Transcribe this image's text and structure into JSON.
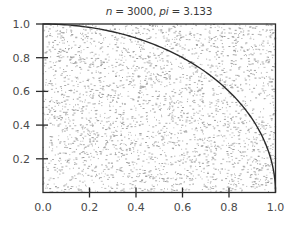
{
  "chart_data": {
    "type": "scatter",
    "title": "n = 3000, pi = 3.133",
    "title_parts": {
      "n_label": "n",
      "n_value": "3000",
      "pi_label": "pi",
      "pi_value": "3.133"
    },
    "xlabel": "",
    "ylabel": "",
    "xlim": [
      0.0,
      1.0
    ],
    "ylim": [
      0.0,
      1.0
    ],
    "x_ticks": [
      0.0,
      0.2,
      0.4,
      0.6,
      0.8,
      1.0
    ],
    "x_tick_labels": [
      "0.0",
      "0.2",
      "0.4",
      "0.6",
      "0.8",
      "1.0"
    ],
    "y_ticks": [
      0.2,
      0.4,
      0.6,
      0.8,
      1.0
    ],
    "y_tick_labels": [
      "0.2",
      "0.4",
      "0.6",
      "0.8",
      "1.0"
    ],
    "grid": false,
    "legend": null,
    "series": [
      {
        "name": "random points",
        "kind": "scatter",
        "count": 3000,
        "distribution": "uniform on unit square [0,1] x [0,1]",
        "marker": "small dot",
        "color": "#9a9a9a"
      },
      {
        "name": "quarter circle",
        "kind": "line",
        "equation": "y = sqrt(1 - x^2)",
        "x_range": [
          0.0,
          1.0
        ],
        "color": "#2b2b2b"
      }
    ],
    "estimate": {
      "n": 3000,
      "pi": 3.133
    }
  },
  "colors": {
    "frame": "#2b2b2b",
    "curve": "#2b2b2b",
    "points": "#9a9a9a",
    "labels": "#4a4a4a",
    "background": "#ffffff"
  }
}
